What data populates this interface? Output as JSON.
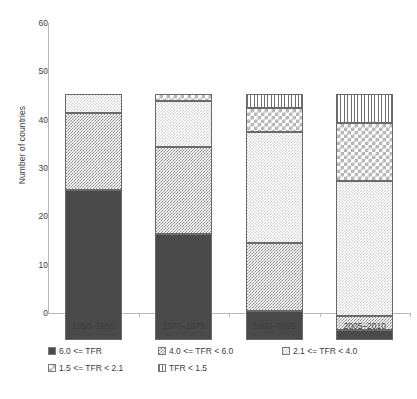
{
  "chart_data": {
    "type": "bar",
    "subtype": "stacked-bar",
    "title": "",
    "xlabel": "",
    "ylabel": "Number of countries",
    "ylim": [
      0,
      60
    ],
    "yticks": [
      0,
      10,
      20,
      30,
      40,
      50,
      60
    ],
    "ytick_labels": [
      "0",
      "10",
      "20",
      "30",
      "40",
      "50",
      "60"
    ],
    "grid": false,
    "legend_position": "bottom",
    "categories": [
      "1950–1955",
      "1970–1975",
      "1990–1995",
      "2005–2010"
    ],
    "series": [
      {
        "name": "6.0 <= TFR",
        "pattern": "solid-dark",
        "values": [
          31,
          22,
          6,
          2
        ]
      },
      {
        "name": "4.0 <= TFR < 6.0",
        "pattern": "checker-mid",
        "values": [
          16,
          18,
          14,
          3
        ]
      },
      {
        "name": "2.1 <= TFR < 4.0",
        "pattern": "dots-light",
        "values": [
          4,
          9.5,
          23,
          28
        ]
      },
      {
        "name": "1.5 <= TFR < 2.1",
        "pattern": "checker-big",
        "values": [
          0,
          1.5,
          5,
          12
        ]
      },
      {
        "name": "TFR < 1.5",
        "pattern": "vlines",
        "values": [
          0,
          0,
          3,
          6
        ]
      }
    ],
    "totals": [
      51,
      51,
      51,
      51
    ],
    "stack_boundaries": [
      [
        0,
        31,
        47,
        51,
        51,
        51
      ],
      [
        0,
        22,
        40,
        49.5,
        51,
        51
      ],
      [
        0,
        6,
        20,
        43,
        48,
        51
      ],
      [
        0,
        2,
        5,
        33,
        45,
        51
      ]
    ]
  },
  "axes": {
    "y_title": "Number of countries",
    "y_ticks": [
      "60",
      "50",
      "40",
      "30",
      "20",
      "10",
      "0"
    ],
    "x_ticks": [
      "1950–1955",
      "1970–1975",
      "1990–1995",
      "2005–2010"
    ]
  },
  "legend": {
    "items": [
      {
        "label": "6.0 <= TFR",
        "pattern": "solid-dark"
      },
      {
        "label": "4.0 <= TFR < 6.0",
        "pattern": "checker-mid"
      },
      {
        "label": "2.1 <= TFR < 4.0",
        "pattern": "dots-light"
      },
      {
        "label": "1.5 <= TFR < 2.1",
        "pattern": "checker-big"
      },
      {
        "label": "TFR < 1.5",
        "pattern": "vlines"
      }
    ]
  },
  "colors": {
    "solid_dark": "#4a4a4a",
    "checker_mid": "#8d8d8d",
    "dots_light": "#cfcfcf",
    "checker_big": "#b3b3b3",
    "vlines": "#6f6f6f",
    "axis": "#b9b9b9",
    "text": "#3d3d3d",
    "background": "#ffffff"
  }
}
